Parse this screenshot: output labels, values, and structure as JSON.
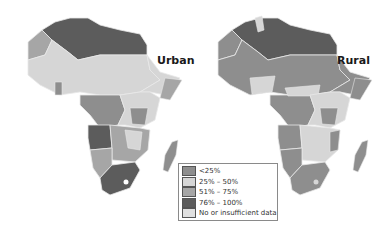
{
  "maps": [
    {
      "title": "Urban",
      "subject": "Africa",
      "category_colors": {
        "north": "#5c5c5c",
        "west": "#d6d6d6",
        "central": "#8e8e8e",
        "angola": "#5c5c5c",
        "south": "#5c5c5c",
        "southern": "#a6a6a6",
        "madagascar": "#8e8e8e",
        "horn": "#a6a6a6"
      }
    },
    {
      "title": "Rural",
      "subject": "Africa",
      "category_colors": {
        "north": "#5c5c5c",
        "west": "#8e8e8e",
        "central": "#8e8e8e",
        "angola": "#8e8e8e",
        "south": "#8e8e8e",
        "southern": "#d6d6d6",
        "madagascar": "#8e8e8e",
        "horn": "#8e8e8e"
      }
    }
  ],
  "legend": {
    "items": [
      {
        "label": "<25%",
        "color": "#8e8e8e"
      },
      {
        "label": "25% – 50%",
        "color": "#d6d6d6"
      },
      {
        "label": "51% – 75%",
        "color": "#a6a6a6"
      },
      {
        "label": "76% – 100%",
        "color": "#5c5c5c"
      },
      {
        "label": "No or insufficient data",
        "color": "#e0e0e0"
      }
    ]
  }
}
